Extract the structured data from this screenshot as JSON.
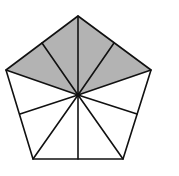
{
  "diagram": {
    "title": "",
    "colors": {
      "background": "#ffffff",
      "stroke": "#111111",
      "shade": "#b3b3b3",
      "unshaded": "#ffffff"
    },
    "center": [
      78,
      95
    ],
    "vertices": [
      [
        78,
        16
      ],
      [
        151,
        70
      ],
      [
        123,
        159
      ],
      [
        33,
        159
      ],
      [
        6,
        70
      ]
    ],
    "edge_midpoints": [
      [
        114,
        43
      ],
      [
        137,
        114
      ],
      [
        78,
        159
      ],
      [
        20,
        114
      ],
      [
        42,
        43
      ]
    ],
    "total_parts": 10,
    "shaded_parts": 4,
    "shaded_fraction": "4/10"
  }
}
